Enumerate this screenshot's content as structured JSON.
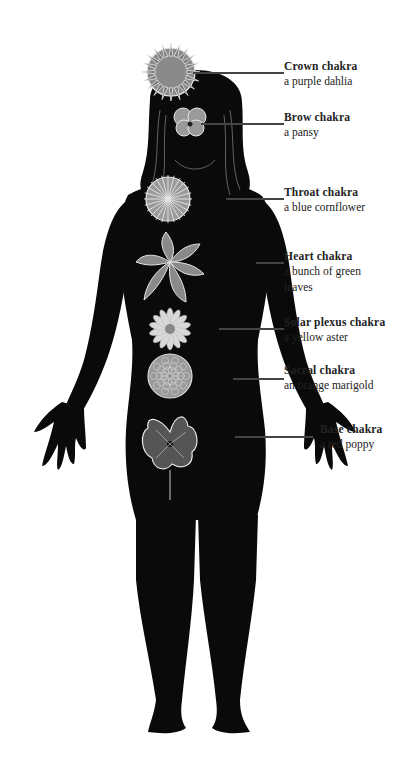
{
  "figure": {
    "colors": {
      "silhouette": "#0a0a0a",
      "flower_fill": "#8a8a8a",
      "flower_light": "#cfcfcf",
      "outline": "#e8e8e8",
      "leader": "#444444",
      "text": "#222222"
    }
  },
  "chakras": [
    {
      "name": "Crown chakra",
      "flower": "a purple dahlia"
    },
    {
      "name": "Brow chakra",
      "flower": "a pansy"
    },
    {
      "name": "Throat chakra",
      "flower": "a blue cornflower"
    },
    {
      "name": "Heart chakra",
      "flower": "a bunch of green leaves"
    },
    {
      "name": "Solar plexus chakra",
      "flower": "a yellow aster"
    },
    {
      "name": "Sacral chakra",
      "flower": "an orange marigold"
    },
    {
      "name": "Base chakra",
      "flower": "a red poppy"
    }
  ]
}
